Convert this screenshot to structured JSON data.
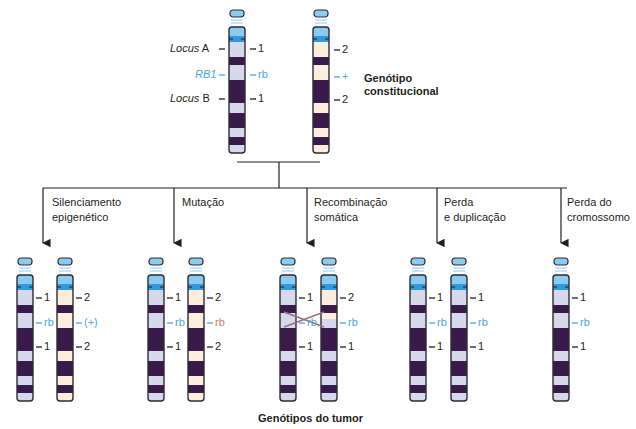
{
  "diagram": {
    "title_top": "Genótipo constitucional",
    "title_top_line1": "Genótipo",
    "title_top_line2": "constitucional",
    "title_bottom": "Genótipos do tumor",
    "colors": {
      "dark_band": "#3a1a4a",
      "light_band_maternal": "#d6d8ec",
      "light_band_paternal": "#fbeedd",
      "centromere_blue": "#2e9be0",
      "cap_blue": "#8ccaf0",
      "outline": "#2d2d35",
      "rb_blue": "#4aa8e0",
      "mutant_red": "#e8765a",
      "cross_line": "#9a7080"
    },
    "constitutional": {
      "left_labels": {
        "locus_a": "Locus",
        "locus_a_letter": "A",
        "rb1": "RB1",
        "locus_b": "Locus",
        "locus_b_letter": "B"
      },
      "chromosome_1": {
        "locus_a": "1",
        "rb": "rb",
        "locus_b": "1"
      },
      "chromosome_2": {
        "locus_a": "2",
        "rb": "+",
        "locus_b": "2"
      }
    },
    "processes": [
      {
        "label_line1": "Silenciamento",
        "label_line2": "epigenético",
        "chrom_1": {
          "a": "1",
          "rb": "rb",
          "b": "1"
        },
        "chrom_2": {
          "a": "2",
          "rb": "(+)",
          "b": "2"
        }
      },
      {
        "label_line1": "Mutação",
        "label_line2": "",
        "chrom_1": {
          "a": "1",
          "rb": "rb",
          "b": "1"
        },
        "chrom_2": {
          "a": "2",
          "rb": "rb",
          "b": "2"
        }
      },
      {
        "label_line1": "Recombinação",
        "label_line2": "somática",
        "chrom_1": {
          "a": "1",
          "rb": "rb",
          "b": "1"
        },
        "chrom_2": {
          "a": "2",
          "rb": "rb",
          "b": "1"
        }
      },
      {
        "label_line1": "Perda",
        "label_line2": "e duplicação",
        "chrom_1": {
          "a": "1",
          "rb": "rb",
          "b": "1"
        },
        "chrom_2": {
          "a": "1",
          "rb": "rb",
          "b": "1"
        }
      },
      {
        "label_line1": "Perda do",
        "label_line2": "cromossomo",
        "chrom_1": {
          "a": "1",
          "rb": "rb",
          "b": "1"
        }
      }
    ]
  }
}
